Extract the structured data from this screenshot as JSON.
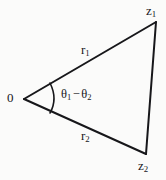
{
  "figure": {
    "kind": "geometry-diagram",
    "background_color": "#fbfbfa",
    "stroke_color": "#17171a",
    "labels": {
      "origin": "0",
      "z_upper_base": "z",
      "z_upper_sub": "1",
      "z_lower_base": "z",
      "z_lower_sub": "2",
      "r_upper_base": "r",
      "r_upper_sub": "1",
      "r_lower_base": "r",
      "r_lower_sub": "2",
      "theta_base": "θ",
      "theta_first_sub": "1",
      "theta_minus": "−",
      "theta_second_base": "θ",
      "theta_second_sub": "2"
    },
    "geometry": {
      "vertex_origin": [
        24,
        99
      ],
      "vertex_z1": [
        156,
        22
      ],
      "vertex_z2": [
        146,
        154
      ],
      "arc_start": [
        50,
        83
      ],
      "arc_end": [
        50,
        113
      ],
      "arc_bulge_x": 57
    }
  }
}
